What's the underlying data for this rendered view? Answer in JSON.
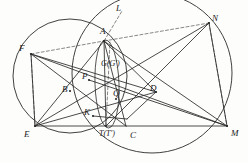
{
  "figure": {
    "kind": "euclidean-geometry-diagram",
    "width": 248,
    "height": 163,
    "background_color": "#fdfdfc",
    "stroke_color": "#2b2b2b",
    "dash_color": "#555555",
    "label_color": "#1b1b1b"
  },
  "labels": [
    {
      "id": "A",
      "text": "A",
      "x": 100,
      "y": 27,
      "size": 9
    },
    {
      "id": "L",
      "text": "L",
      "x": 116,
      "y": 4,
      "size": 9
    },
    {
      "id": "N",
      "text": "N",
      "x": 212,
      "y": 14,
      "size": 9
    },
    {
      "id": "F",
      "text": "F",
      "x": 19,
      "y": 44,
      "size": 9
    },
    {
      "id": "E",
      "text": "E",
      "x": 24,
      "y": 130,
      "size": 9
    },
    {
      "id": "M",
      "text": "M",
      "x": 231,
      "y": 129,
      "size": 9
    },
    {
      "id": "C",
      "text": "C",
      "x": 130,
      "y": 131,
      "size": 9
    },
    {
      "id": "TT",
      "text": "T(T')",
      "x": 99,
      "y": 130,
      "size": 8
    },
    {
      "id": "K",
      "text": "K",
      "x": 84,
      "y": 108,
      "size": 9
    },
    {
      "id": "B",
      "text": "B",
      "x": 62,
      "y": 85,
      "size": 9
    },
    {
      "id": "P",
      "text": "P",
      "x": 82,
      "y": 72,
      "size": 9
    },
    {
      "id": "Q",
      "text": "Q",
      "x": 113,
      "y": 89,
      "size": 9
    },
    {
      "id": "D",
      "text": "D",
      "x": 150,
      "y": 84,
      "size": 9
    },
    {
      "id": "GG",
      "text": "G(G')",
      "x": 101,
      "y": 60,
      "size": 8
    }
  ],
  "points": {
    "A": {
      "x": 104,
      "y": 41
    },
    "L": {
      "x": 122,
      "y": 11
    },
    "N": {
      "x": 209,
      "y": 23
    },
    "F": {
      "x": 31,
      "y": 54
    },
    "E": {
      "x": 35,
      "y": 126
    },
    "T": {
      "x": 106,
      "y": 126
    },
    "C": {
      "x": 126,
      "y": 126
    },
    "M": {
      "x": 227,
      "y": 126
    },
    "B": {
      "x": 70,
      "y": 91
    },
    "P": {
      "x": 89,
      "y": 80
    },
    "Q": {
      "x": 116,
      "y": 99
    },
    "D": {
      "x": 156,
      "y": 92
    },
    "G": {
      "x": 106,
      "y": 72
    },
    "K": {
      "x": 93,
      "y": 116
    },
    "S": {
      "x": 127,
      "y": 119
    }
  },
  "circles": [
    {
      "id": "circle-left",
      "cx": 70,
      "cy": 76,
      "r": 57,
      "style": "solid"
    },
    {
      "id": "circle-right",
      "cx": 152,
      "cy": 73,
      "r": 80,
      "style": "solid"
    }
  ],
  "ellipses": [
    {
      "id": "lens-ellipse",
      "cx": 107,
      "cy": 84,
      "rx": 12,
      "ry": 44,
      "rotate": -2,
      "style": "solid"
    }
  ],
  "solid_segments": [
    {
      "id": "E-M",
      "from": "E",
      "to": "M"
    },
    {
      "id": "F-E",
      "from": "F",
      "to": "E"
    },
    {
      "id": "F-M",
      "from": "F",
      "to": "M"
    },
    {
      "id": "F-C",
      "from": "F",
      "to": "C"
    },
    {
      "id": "F-D",
      "from": "F",
      "to": "D"
    },
    {
      "id": "A-E",
      "from": "A",
      "to": "E"
    },
    {
      "id": "A-T",
      "from": "A",
      "to": "T"
    },
    {
      "id": "A-C",
      "from": "A",
      "to": "C"
    },
    {
      "id": "A-M",
      "from": "A",
      "to": "M"
    },
    {
      "id": "A-D",
      "from": "A",
      "to": "D"
    },
    {
      "id": "E-N",
      "from": "E",
      "to": "N"
    },
    {
      "id": "T-N",
      "from": "T",
      "to": "N"
    },
    {
      "id": "N-M",
      "from": "N",
      "to": "M"
    },
    {
      "id": "E-D",
      "from": "E",
      "to": "D"
    },
    {
      "id": "D-S",
      "from": "D",
      "to": "S"
    },
    {
      "id": "K-S",
      "from": "K",
      "to": "S"
    },
    {
      "id": "P-M",
      "from": "P",
      "to": "M"
    }
  ],
  "dashed_segments": [
    {
      "id": "F-A",
      "from": "F",
      "to": "A"
    },
    {
      "id": "A-N",
      "from": "A",
      "to": "N"
    },
    {
      "id": "A-L",
      "from": "A",
      "to": "L"
    },
    {
      "id": "F-down",
      "x1": 31,
      "y1": 54,
      "x2": 35,
      "y2": 126
    },
    {
      "id": "N-down",
      "x1": 209,
      "y1": 23,
      "x2": 227,
      "y2": 126
    },
    {
      "id": "T-up",
      "x1": 106,
      "y1": 126,
      "x2": 110,
      "y2": 42
    }
  ],
  "dot_points": [
    "A",
    "N",
    "F",
    "E",
    "T",
    "M",
    "B",
    "P",
    "Q",
    "D",
    "K"
  ]
}
